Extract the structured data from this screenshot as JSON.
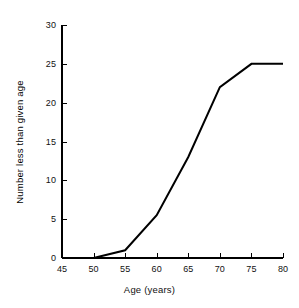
{
  "chart_data": {
    "type": "line",
    "title": "",
    "xlabel": "Age (years)",
    "ylabel": "Number less than given age",
    "xlim": [
      45,
      80
    ],
    "ylim": [
      0,
      30
    ],
    "xticks": [
      45,
      50,
      55,
      60,
      65,
      70,
      75,
      80
    ],
    "yticks": [
      0,
      5,
      10,
      15,
      20,
      25,
      30
    ],
    "xtick_labels": [
      "45",
      "50",
      "55",
      "60",
      "65",
      "70",
      "75",
      "80"
    ],
    "ytick_labels": [
      "0",
      "5",
      "10",
      "15",
      "20",
      "25",
      "30"
    ],
    "grid": false,
    "legend": "none",
    "series": [
      {
        "name": "cumulative count",
        "color": "#000000",
        "line_width": 2,
        "x": [
          45,
          50,
          55,
          60,
          65,
          70,
          75,
          80
        ],
        "values": [
          0,
          0,
          1,
          5.5,
          13,
          22,
          25,
          25
        ],
        "points": [
          {
            "x": 45,
            "y": 0
          },
          {
            "x": 50,
            "y": 0
          },
          {
            "x": 55,
            "y": 1
          },
          {
            "x": 60,
            "y": 5.5
          },
          {
            "x": 65,
            "y": 13
          },
          {
            "x": 70,
            "y": 22
          },
          {
            "x": 75,
            "y": 25
          },
          {
            "x": 80,
            "y": 25
          }
        ]
      }
    ],
    "axis_color": "#000000",
    "background_color": "#ffffff",
    "tick_direction": "in"
  }
}
